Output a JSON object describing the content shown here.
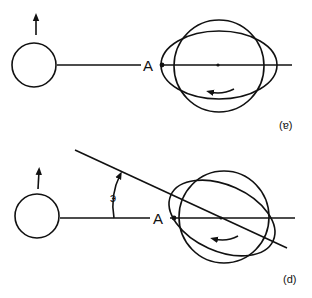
{
  "figure": {
    "panels": [
      {
        "id": "a",
        "caption": "(ɐ)",
        "point_label": "A",
        "description": "Moon with upward velocity arrow, line to Earth with tidal bulge ellipse aligned with Earth-Moon line, rotation arrow"
      },
      {
        "id": "d",
        "caption": "(d)",
        "point_label": "A",
        "angle_label": "э",
        "description": "Moon with upward velocity arrow, tidal bulge ellipse rotated by angle relative to Earth-Moon line, rotation arrow"
      }
    ],
    "colors": {
      "ink": "#111111",
      "background": "#ffffff"
    }
  }
}
